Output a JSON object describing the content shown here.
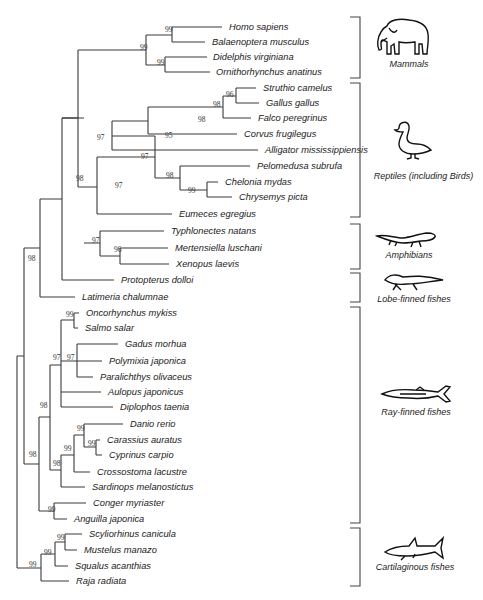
{
  "figure": {
    "type": "phylogenetic-tree",
    "taxa": [
      {
        "name": "Homo sapiens",
        "y": 27,
        "x": 226
      },
      {
        "name": "Balaenoptera musculus",
        "y": 42,
        "x": 209
      },
      {
        "name": "Didelphis virginiana",
        "y": 57,
        "x": 210
      },
      {
        "name": "Ornithorhynchus anatinus",
        "y": 72,
        "x": 213
      },
      {
        "name": "Struthio camelus",
        "y": 88,
        "x": 260
      },
      {
        "name": "Gallus gallus",
        "y": 103,
        "x": 263
      },
      {
        "name": "Falco peregrinus",
        "y": 118,
        "x": 255
      },
      {
        "name": "Corvus frugilegus",
        "y": 134,
        "x": 241
      },
      {
        "name": "Alligator mississippiensis",
        "y": 150,
        "x": 262
      },
      {
        "name": "Pelomedusa subrufa",
        "y": 166,
        "x": 254
      },
      {
        "name": "Chelonia mydas",
        "y": 182,
        "x": 222
      },
      {
        "name": "Chrysemys picta",
        "y": 197,
        "x": 236
      },
      {
        "name": "Eumeces egregius",
        "y": 214,
        "x": 176
      },
      {
        "name": "Typhlonectes natans",
        "y": 231,
        "x": 168
      },
      {
        "name": "Mertensiella luschani",
        "y": 248,
        "x": 172
      },
      {
        "name": "Xenopus laevis",
        "y": 264,
        "x": 173
      },
      {
        "name": "Protopterus dolloi",
        "y": 280,
        "x": 118
      },
      {
        "name": "Latimeria chalumnae",
        "y": 297,
        "x": 79
      },
      {
        "name": "Oncorhynchus mykiss",
        "y": 313,
        "x": 83
      },
      {
        "name": "Salmo salar",
        "y": 328,
        "x": 82
      },
      {
        "name": "Gadus morhua",
        "y": 344,
        "x": 122
      },
      {
        "name": "Polymixia japonica",
        "y": 361,
        "x": 106
      },
      {
        "name": "Paralichthys olivaceus",
        "y": 377,
        "x": 97
      },
      {
        "name": "Aulopus japonicus",
        "y": 392,
        "x": 105
      },
      {
        "name": "Diplophos taenia",
        "y": 407,
        "x": 117
      },
      {
        "name": "Danio rerio",
        "y": 424,
        "x": 127
      },
      {
        "name": "Carassius auratus",
        "y": 440,
        "x": 104
      },
      {
        "name": "Cyprinus carpio",
        "y": 455,
        "x": 106
      },
      {
        "name": "Crossostoma lacustre",
        "y": 472,
        "x": 94
      },
      {
        "name": "Sardinops melanostictus",
        "y": 487,
        "x": 89
      },
      {
        "name": "Conger myriaster",
        "y": 503,
        "x": 90
      },
      {
        "name": "Anguilla japonica",
        "y": 519,
        "x": 71
      },
      {
        "name": "Scyliorhinus canicula",
        "y": 534,
        "x": 86
      },
      {
        "name": "Mustelus manazo",
        "y": 550,
        "x": 81
      },
      {
        "name": "Squalus acanthias",
        "y": 566,
        "x": 72
      },
      {
        "name": "Raja radiata",
        "y": 581,
        "x": 73
      }
    ],
    "bootstrap": [
      {
        "value": "99",
        "x": 165,
        "y": 32
      },
      {
        "value": "99",
        "x": 140,
        "y": 50
      },
      {
        "value": "99",
        "x": 157,
        "y": 65
      },
      {
        "value": "96",
        "x": 226,
        "y": 97
      },
      {
        "value": "98",
        "x": 213,
        "y": 107
      },
      {
        "value": "98",
        "x": 198,
        "y": 122
      },
      {
        "value": "95",
        "x": 165,
        "y": 138
      },
      {
        "value": "97",
        "x": 97,
        "y": 140
      },
      {
        "value": "97",
        "x": 141,
        "y": 159
      },
      {
        "value": "98",
        "x": 166,
        "y": 178
      },
      {
        "value": "99",
        "x": 188,
        "y": 193
      },
      {
        "value": "97",
        "x": 115,
        "y": 188
      },
      {
        "value": "98",
        "x": 76,
        "y": 181
      },
      {
        "value": "97",
        "x": 92,
        "y": 243
      },
      {
        "value": "96",
        "x": 114,
        "y": 252
      },
      {
        "value": "98",
        "x": 28,
        "y": 261
      },
      {
        "value": "99",
        "x": 66,
        "y": 317
      },
      {
        "value": "97",
        "x": 53,
        "y": 360
      },
      {
        "value": "97",
        "x": 67,
        "y": 360
      },
      {
        "value": "98",
        "x": 40,
        "y": 408
      },
      {
        "value": "99",
        "x": 77,
        "y": 431
      },
      {
        "value": "99",
        "x": 88,
        "y": 446
      },
      {
        "value": "99",
        "x": 64,
        "y": 451
      },
      {
        "value": "98",
        "x": 53,
        "y": 466
      },
      {
        "value": "98",
        "x": 29,
        "y": 457
      },
      {
        "value": "99",
        "x": 48,
        "y": 512
      },
      {
        "value": "99",
        "x": 57,
        "y": 540
      },
      {
        "value": "99",
        "x": 44,
        "y": 555
      },
      {
        "value": "99",
        "x": 29,
        "y": 567
      }
    ],
    "groups": [
      {
        "label": "Mammals",
        "icon": "elephant-icon",
        "bracket_top": 17,
        "bracket_bottom": 78,
        "label_y": 63
      },
      {
        "label": "Reptiles (including Birds)",
        "icon": "duck-icon",
        "bracket_top": 83,
        "bracket_bottom": 217,
        "label_y": 175
      },
      {
        "label": "Amphibians",
        "icon": "salamander-icon",
        "bracket_top": 224,
        "bracket_bottom": 269,
        "label_y": 254
      },
      {
        "label": "Lobe-finned fishes",
        "icon": "lungfish-icon",
        "bracket_top": 273,
        "bracket_bottom": 302,
        "label_y": 297
      },
      {
        "label": "Ray-finned fishes",
        "icon": "sturgeon-icon",
        "bracket_top": 307,
        "bracket_bottom": 523,
        "label_y": 411
      },
      {
        "label": "Cartilaginous fishes",
        "icon": "shark-icon",
        "bracket_top": 528,
        "bracket_bottom": 586,
        "label_y": 566
      }
    ]
  }
}
